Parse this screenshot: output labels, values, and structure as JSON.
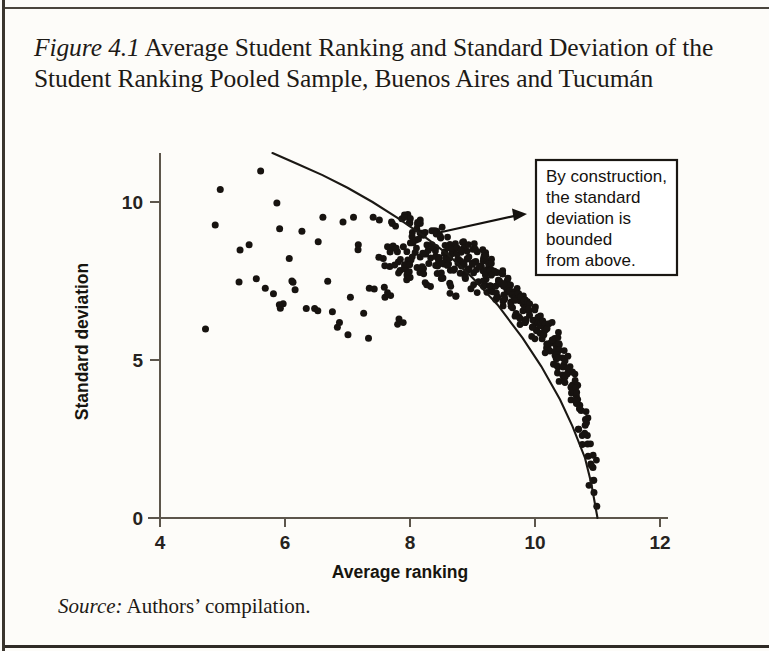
{
  "figure": {
    "label": "Figure",
    "number": "4.1",
    "title_rest": " Average Student Ranking and Standard Deviation of the Student Ranking Pooled Sample, Buenos Aires and Tucumán",
    "full_title": "Figure 4.1 Average Student Ranking and Standard Deviation of the Student Ranking Pooled Sample, Buenos Aires and Tucumán"
  },
  "source": {
    "label": "Source:",
    "text": " Authors’ compilation."
  },
  "annotation": {
    "lines": [
      "By construction,",
      "the standard",
      "deviation is",
      "bounded",
      "from above."
    ],
    "full_text": "By construction, the standard deviation is bounded from above."
  },
  "colors": {
    "ink": "#171310",
    "axis": "#5d564c",
    "paper": "#fdfcf9",
    "box_border": "#1a1713"
  },
  "chart_data": {
    "type": "scatter",
    "title": "Average Student Ranking and Standard Deviation of the Student Ranking Pooled Sample, Buenos Aires and Tucumán",
    "xlabel": "Average ranking",
    "ylabel": "Standard deviation",
    "xlim": [
      3.8,
      12.2
    ],
    "ylim": [
      0,
      11.6
    ],
    "xticks": [
      4,
      6,
      8,
      10,
      12
    ],
    "yticks": [
      0,
      5,
      10
    ],
    "grid": false,
    "legend": null,
    "annotations": [
      {
        "text": "By construction, the standard deviation is bounded from above.",
        "points_to": [
          8.5,
          8.2
        ]
      }
    ],
    "series": [
      {
        "name": "Upper bound curve",
        "type": "line",
        "note": "Theoretical maximum standard deviation given the average ranking; reaches 0 at average ranking 11.",
        "x": [
          5.8,
          6.2,
          6.6,
          7.0,
          7.4,
          7.8,
          8.2,
          8.6,
          9.0,
          9.4,
          9.8,
          10.1,
          10.4,
          10.6,
          10.8,
          10.9,
          11.0
        ],
        "y": [
          11.55,
          11.2,
          10.85,
          10.45,
          10.0,
          9.5,
          8.95,
          8.35,
          7.6,
          6.75,
          5.7,
          4.8,
          3.75,
          2.9,
          1.9,
          1.1,
          0.0
        ]
      },
      {
        "name": "Schools (pooled sample)",
        "type": "scatter",
        "n": 470,
        "points": [
          [
            4.72,
            5.95
          ],
          [
            4.88,
            9.35
          ],
          [
            4.95,
            10.4
          ],
          [
            5.25,
            8.55
          ],
          [
            5.3,
            7.55
          ],
          [
            5.45,
            8.6
          ],
          [
            5.5,
            7.5
          ],
          [
            5.62,
            10.9
          ],
          [
            5.72,
            7.3
          ],
          [
            5.78,
            7.15
          ],
          [
            5.85,
            9.9
          ],
          [
            5.9,
            6.75
          ],
          [
            5.95,
            6.7
          ],
          [
            5.95,
            9.2
          ],
          [
            6.0,
            6.7
          ],
          [
            6.05,
            8.25
          ],
          [
            6.08,
            7.55
          ],
          [
            6.1,
            7.5
          ],
          [
            6.2,
            7.2
          ],
          [
            6.3,
            9.1
          ],
          [
            6.35,
            6.6
          ],
          [
            6.45,
            6.6
          ],
          [
            6.5,
            8.75
          ],
          [
            6.55,
            6.55
          ],
          [
            6.6,
            9.5
          ],
          [
            6.7,
            7.55
          ],
          [
            6.75,
            6.5
          ],
          [
            6.82,
            6.05
          ],
          [
            6.88,
            6.2
          ],
          [
            6.95,
            9.3
          ],
          [
            7.0,
            5.8
          ],
          [
            7.05,
            6.95
          ],
          [
            7.1,
            9.45
          ],
          [
            7.15,
            8.6
          ],
          [
            7.2,
            8.55
          ],
          [
            7.25,
            6.5
          ],
          [
            7.3,
            5.65
          ],
          [
            7.35,
            7.25
          ],
          [
            7.4,
            9.55
          ],
          [
            7.45,
            7.2
          ],
          [
            7.5,
            9.35
          ],
          [
            7.52,
            8.3
          ],
          [
            7.55,
            8.2
          ],
          [
            7.6,
            7.3
          ],
          [
            7.62,
            6.95
          ],
          [
            7.65,
            8.45
          ],
          [
            7.7,
            7.95
          ],
          [
            7.75,
            9.4
          ],
          [
            7.78,
            8.5
          ],
          [
            7.8,
            6.3
          ],
          [
            7.85,
            7.85
          ],
          [
            7.88,
            8.0
          ],
          [
            7.9,
            9.5
          ],
          [
            7.92,
            8.6
          ],
          [
            7.95,
            8.1
          ],
          [
            7.98,
            7.6
          ],
          [
            8.0,
            9.55
          ],
          [
            8.02,
            8.85
          ],
          [
            8.05,
            8.4
          ],
          [
            8.08,
            7.9
          ],
          [
            8.1,
            9.3
          ],
          [
            8.12,
            8.75
          ],
          [
            8.15,
            8.2
          ],
          [
            8.18,
            7.7
          ],
          [
            8.2,
            9.35
          ],
          [
            8.22,
            8.95
          ],
          [
            8.25,
            8.5
          ],
          [
            8.28,
            8.05
          ],
          [
            8.3,
            7.35
          ],
          [
            8.32,
            9.1
          ],
          [
            8.35,
            8.65
          ],
          [
            8.38,
            8.25
          ],
          [
            8.4,
            7.8
          ],
          [
            8.42,
            9.0
          ],
          [
            8.45,
            8.55
          ],
          [
            8.48,
            8.15
          ],
          [
            8.5,
            7.6
          ],
          [
            8.52,
            8.85
          ],
          [
            8.55,
            8.45
          ],
          [
            8.58,
            8.05
          ],
          [
            8.6,
            7.45
          ],
          [
            8.62,
            8.7
          ],
          [
            8.65,
            8.35
          ],
          [
            8.68,
            7.95
          ],
          [
            8.7,
            6.95
          ],
          [
            8.72,
            8.6
          ],
          [
            8.75,
            8.2
          ],
          [
            8.78,
            7.75
          ],
          [
            8.8,
            8.75
          ],
          [
            8.82,
            8.45
          ],
          [
            8.85,
            8.05
          ],
          [
            8.88,
            7.6
          ],
          [
            8.9,
            8.6
          ],
          [
            8.92,
            8.25
          ],
          [
            8.95,
            7.85
          ],
          [
            8.98,
            7.2
          ],
          [
            9.0,
            8.5
          ],
          [
            9.02,
            8.15
          ],
          [
            9.05,
            7.7
          ],
          [
            9.08,
            8.35
          ],
          [
            9.1,
            8.0
          ],
          [
            9.12,
            7.55
          ],
          [
            9.15,
            8.25
          ],
          [
            9.18,
            7.9
          ],
          [
            9.2,
            7.4
          ],
          [
            9.22,
            8.15
          ],
          [
            9.25,
            7.8
          ],
          [
            9.28,
            7.3
          ],
          [
            9.3,
            8.0
          ],
          [
            9.32,
            7.65
          ],
          [
            9.35,
            7.2
          ],
          [
            9.38,
            7.85
          ],
          [
            9.4,
            7.5
          ],
          [
            9.42,
            7.1
          ],
          [
            9.45,
            7.7
          ],
          [
            9.48,
            7.35
          ],
          [
            9.5,
            6.95
          ],
          [
            9.52,
            7.55
          ],
          [
            9.55,
            7.2
          ],
          [
            9.58,
            6.8
          ],
          [
            9.6,
            7.4
          ],
          [
            9.62,
            7.05
          ],
          [
            9.65,
            6.65
          ],
          [
            9.68,
            7.25
          ],
          [
            9.7,
            6.9
          ],
          [
            9.72,
            6.5
          ],
          [
            9.75,
            7.1
          ],
          [
            9.78,
            6.75
          ],
          [
            9.8,
            6.3
          ],
          [
            9.82,
            6.95
          ],
          [
            9.85,
            6.6
          ],
          [
            9.88,
            6.15
          ],
          [
            9.9,
            6.8
          ],
          [
            9.92,
            6.45
          ],
          [
            9.95,
            6.0
          ],
          [
            9.98,
            6.6
          ],
          [
            10.0,
            6.25
          ],
          [
            10.02,
            5.85
          ],
          [
            10.05,
            6.4
          ],
          [
            10.08,
            6.05
          ],
          [
            10.1,
            5.65
          ],
          [
            10.12,
            6.2
          ],
          [
            10.15,
            5.85
          ],
          [
            10.18,
            5.45
          ],
          [
            10.2,
            6.0
          ],
          [
            10.22,
            5.6
          ],
          [
            10.25,
            5.2
          ],
          [
            10.28,
            5.75
          ],
          [
            10.3,
            5.4
          ],
          [
            10.32,
            5.0
          ],
          [
            10.35,
            5.5
          ],
          [
            10.38,
            5.15
          ],
          [
            10.4,
            4.75
          ],
          [
            10.42,
            5.25
          ],
          [
            10.45,
            4.9
          ],
          [
            10.48,
            4.5
          ],
          [
            10.5,
            4.95
          ],
          [
            10.52,
            4.6
          ],
          [
            10.55,
            4.2
          ],
          [
            10.58,
            4.6
          ],
          [
            10.6,
            4.25
          ],
          [
            10.62,
            3.9
          ],
          [
            10.65,
            4.2
          ],
          [
            10.68,
            3.85
          ],
          [
            10.7,
            3.5
          ],
          [
            10.72,
            3.8
          ],
          [
            10.75,
            3.4
          ],
          [
            10.78,
            3.0
          ],
          [
            10.8,
            3.15
          ],
          [
            10.82,
            2.7
          ],
          [
            10.85,
            2.3
          ],
          [
            10.88,
            2.0
          ],
          [
            10.9,
            1.6
          ],
          [
            10.92,
            1.2
          ],
          [
            10.95,
            0.8
          ],
          [
            10.97,
            0.45
          ]
        ]
      }
    ]
  }
}
